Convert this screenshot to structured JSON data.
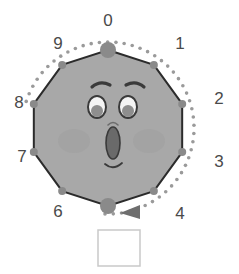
{
  "figure": {
    "shape_name": "decagon",
    "sides": 10,
    "colors": {
      "polygon_fill": "#a8a8a8",
      "polygon_stroke": "#2b2b2b",
      "vertex_dot": "#8a8a8a",
      "dotted_path": "#9a9a9a",
      "label_text": "#4a4a4a",
      "arrow": "#6e6e6e",
      "answer_box_border": "#c9c9c9",
      "answer_box_fill": "#ffffff",
      "eye_white": "#f4f4f4",
      "pupil": "#8e8e8e",
      "mouth": "#6a6a6a",
      "blush": "#9e9e9e",
      "face_line": "#3a3a3a"
    },
    "geometry": {
      "center_x": 108,
      "center_y": 128,
      "radius": 78,
      "dotted_radius": 86,
      "start_angle_deg": -90,
      "vertex_dot_radius": 4,
      "marked_vertex_dot_radius": 8
    }
  },
  "vertices": [
    {
      "index": 0,
      "label": "0",
      "angle_deg": -90,
      "marked": true,
      "label_x": 108,
      "label_y": 22,
      "dot_x": 108,
      "dot_y": 50
    },
    {
      "index": 1,
      "label": "1",
      "angle_deg": -54,
      "marked": false,
      "label_x": 180,
      "label_y": 45,
      "dot_x": 154,
      "dot_y": 65
    },
    {
      "index": 2,
      "label": "2",
      "angle_deg": -18,
      "marked": false,
      "label_x": 219,
      "label_y": 100,
      "dot_x": 182,
      "dot_y": 104
    },
    {
      "index": 3,
      "label": "3",
      "angle_deg": 18,
      "marked": false,
      "label_x": 219,
      "label_y": 163,
      "dot_x": 182,
      "dot_y": 152
    },
    {
      "index": 4,
      "label": "4",
      "angle_deg": 54,
      "marked": false,
      "label_x": 180,
      "label_y": 215,
      "dot_x": 154,
      "dot_y": 191
    },
    {
      "index": 5,
      "label": "",
      "angle_deg": 90,
      "marked": true,
      "label_x": 108,
      "label_y": 236,
      "dot_x": 108,
      "dot_y": 206
    },
    {
      "index": 6,
      "label": "6",
      "angle_deg": 126,
      "marked": false,
      "label_x": 58,
      "label_y": 213,
      "dot_x": 62,
      "dot_y": 191
    },
    {
      "index": 7,
      "label": "7",
      "angle_deg": 162,
      "marked": false,
      "label_x": 22,
      "label_y": 158,
      "dot_x": 34,
      "dot_y": 152
    },
    {
      "index": 8,
      "label": "8",
      "angle_deg": 198,
      "marked": false,
      "label_x": 19,
      "label_y": 104,
      "dot_x": 34,
      "dot_y": 104
    },
    {
      "index": 9,
      "label": "9",
      "angle_deg": 234,
      "marked": false,
      "label_x": 58,
      "label_y": 45,
      "dot_x": 62,
      "dot_y": 65
    }
  ],
  "dotted_path": {
    "description": "dotted circular arc indicating rotation trace",
    "start_angle_deg": 198,
    "end_angle_deg": 92,
    "sweep": "clockwise",
    "dot_count": 46,
    "dot_radius": 1.8
  },
  "arrow": {
    "name": "rotation-direction-arrow",
    "x": 131,
    "y": 212,
    "direction": "left",
    "points": "140,205 140,219 120,213"
  },
  "face": {
    "expression": "surprised",
    "eyes": [
      {
        "side": "left",
        "cx": 97,
        "cy": 107,
        "rx": 9,
        "ry": 11,
        "pupil_cx": 97,
        "pupil_cy": 111,
        "pupil_r": 6
      },
      {
        "side": "right",
        "cx": 128,
        "cy": 107,
        "rx": 9,
        "ry": 11,
        "pupil_cx": 128,
        "pupil_cy": 111,
        "pupil_r": 6
      }
    ],
    "eyebrows": [
      {
        "side": "left",
        "d": "M 92 87 Q 100 80 110 85"
      },
      {
        "side": "right",
        "d": "M 126 85 Q 136 80 144 87"
      }
    ],
    "mouth": {
      "cx": 113,
      "cy": 143,
      "rx": 7,
      "ry": 16
    },
    "smile": {
      "d": "M 105 164 Q 113 171 122 163"
    },
    "nose_hint": {
      "d": "M 108 125 Q 113 120 118 125"
    },
    "blush": [
      {
        "side": "left",
        "cx": 74,
        "cy": 141,
        "rx": 16,
        "ry": 12
      },
      {
        "side": "right",
        "cx": 149,
        "cy": 141,
        "rx": 16,
        "ry": 12
      }
    ]
  },
  "answer_box": {
    "name": "answer-input-box",
    "value": "",
    "placeholder": "",
    "x": 98,
    "y": 230,
    "width": 42,
    "height": 36
  }
}
